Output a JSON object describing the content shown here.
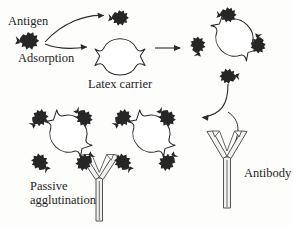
{
  "figure": {
    "background_color": "#fdfdfb",
    "ink_color": "#2a2a2a",
    "antigen_fill": "#262626",
    "carrier_fill": "#ffffff",
    "antibody_fill": "#f2f2f2"
  },
  "labels": {
    "antigen": "Antigen",
    "adsorption": "Adsorption",
    "latex_carrier": "Latex carrier",
    "antibody": "Antibody",
    "passive_line1": "Passive",
    "passive_line2": "agglutination"
  },
  "icons": {
    "antigen": "antigen-blob-icon",
    "carrier": "latex-carrier-icon",
    "antibody": "antibody-y-icon",
    "arrow": "arrow-icon"
  },
  "stages": [
    {
      "id": "free-antigen",
      "label": "Antigen",
      "antigen_count": 1,
      "carrier": false
    },
    {
      "id": "bare-carrier",
      "label": "Latex carrier",
      "antigen_count": 1,
      "carrier": true,
      "note": "one antigen adsorbing at top notch"
    },
    {
      "id": "coated-carrier",
      "label": "",
      "antigen_count": 4,
      "carrier": true,
      "note": "antigen coated latex particle"
    },
    {
      "id": "agglutinated-cluster",
      "label": "Passive agglutination",
      "carrier_count": 2,
      "antigen_count": 8,
      "antibody_count": 3,
      "note": "two coated carriers cross-linked by antibody"
    },
    {
      "id": "free-antibody",
      "label": "Antibody",
      "antibody_count": 1
    }
  ],
  "arrows": [
    {
      "id": "antigen-to-top",
      "kind": "curved",
      "from": "antigen",
      "to": "top-antigen"
    },
    {
      "id": "antigen-to-carrier",
      "kind": "curved",
      "from": "antigen",
      "to": "latex-carrier"
    },
    {
      "id": "carrier-to-coated",
      "kind": "straight",
      "from": "latex-carrier",
      "to": "coated-carrier"
    },
    {
      "id": "coated-to-cluster",
      "kind": "curved",
      "from": "coated-carrier",
      "to": "agglutination-cluster"
    },
    {
      "id": "antibody-to-cluster",
      "kind": "curved",
      "from": "antibody",
      "to": "agglutination-cluster"
    }
  ]
}
